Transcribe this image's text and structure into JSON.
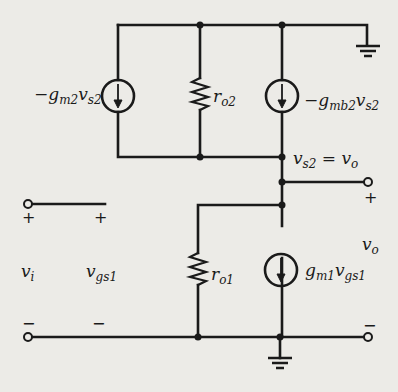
{
  "diagram": {
    "type": "small-signal equivalent circuit",
    "colors": {
      "wire": "#1a1a1a",
      "background": "#ecebe7"
    },
    "components": [
      {
        "id": "source-gm2",
        "kind": "dependent-current-source",
        "direction": "down",
        "label": {
          "prefix": "−g",
          "sub1": "m2",
          "main": "v",
          "sub2": "s2"
        }
      },
      {
        "id": "resistor-ro2",
        "kind": "resistor",
        "label": {
          "main": "r",
          "sub": "o2"
        }
      },
      {
        "id": "source-gmb2",
        "kind": "dependent-current-source",
        "direction": "down",
        "label": {
          "prefix": "−g",
          "sub1": "mb2",
          "main": "v",
          "sub2": "s2"
        }
      },
      {
        "id": "resistor-ro1",
        "kind": "resistor",
        "label": {
          "main": "r",
          "sub": "o1"
        }
      },
      {
        "id": "source-gm1",
        "kind": "dependent-current-source",
        "direction": "down",
        "label": {
          "prefix": "g",
          "sub1": "m1",
          "main": "v",
          "sub2": "gs1"
        }
      }
    ],
    "node_label": {
      "left": "v",
      "left_sub": "s2",
      "eq": " = ",
      "right": "v",
      "right_sub": "o"
    },
    "input": {
      "plus": "+",
      "minus": "−",
      "vi": {
        "main": "v",
        "sub": "i"
      },
      "vgs1": {
        "main": "v",
        "sub": "gs1"
      }
    },
    "output": {
      "plus": "+",
      "minus": "−",
      "vo": {
        "main": "v",
        "sub": "o"
      }
    },
    "grounds": [
      "top-right-ground",
      "bottom-ground"
    ]
  }
}
